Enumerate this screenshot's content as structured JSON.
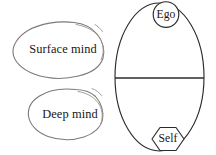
{
  "figure": {
    "background_color": "#ffffff",
    "ink_color": "#2b2b2b",
    "sketch_color": "#7d7a78",
    "blobs": [
      {
        "id": "surface-mind",
        "label": "Surface mind",
        "shape": "hand-drawn-blob",
        "center": {
          "x": 63,
          "y": 49
        }
      },
      {
        "id": "deep-mind",
        "label": "Deep mind",
        "shape": "hand-drawn-blob",
        "center": {
          "x": 70,
          "y": 114
        }
      }
    ],
    "psyche": {
      "shape": "ellipse",
      "center": {
        "x": 159,
        "y": 77
      },
      "radius_x": 45,
      "radius_y": 74,
      "divider": {
        "orientation": "horizontal",
        "y": 78,
        "x_start": 115,
        "x_end": 204
      },
      "nodes": [
        {
          "id": "ego",
          "label": "Ego",
          "shape": "circle",
          "position": "top",
          "center": {
            "x": 166,
            "y": 14
          },
          "radius": 13
        },
        {
          "id": "self",
          "label": "Self",
          "shape": "hexagon",
          "position": "bottom",
          "center": {
            "x": 168,
            "y": 139
          },
          "radius": 16
        }
      ]
    }
  }
}
